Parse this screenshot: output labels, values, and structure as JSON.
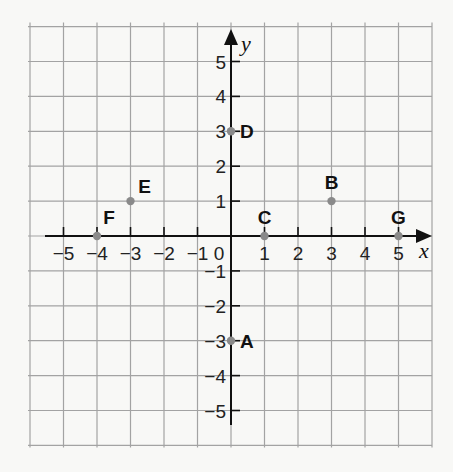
{
  "diagram": {
    "type": "coordinate-plane",
    "grid": {
      "x_min": -6,
      "x_max": 6,
      "y_min": -6,
      "y_max": 6
    },
    "axes": {
      "x_label": "x",
      "y_label": "y",
      "x_ticks": [
        {
          "value": -5,
          "label": "−5"
        },
        {
          "value": -4,
          "label": "−4"
        },
        {
          "value": -3,
          "label": "−3"
        },
        {
          "value": -2,
          "label": "−2"
        },
        {
          "value": -1,
          "label": "−1"
        },
        {
          "value": 0,
          "label": "0"
        },
        {
          "value": 1,
          "label": "1"
        },
        {
          "value": 2,
          "label": "2"
        },
        {
          "value": 3,
          "label": "3"
        },
        {
          "value": 4,
          "label": "4"
        },
        {
          "value": 5,
          "label": "5"
        }
      ],
      "y_ticks": [
        {
          "value": 5,
          "label": "5"
        },
        {
          "value": 4,
          "label": "4"
        },
        {
          "value": 3,
          "label": "3"
        },
        {
          "value": 2,
          "label": "2"
        },
        {
          "value": 1,
          "label": "1"
        },
        {
          "value": -1,
          "label": "−1"
        },
        {
          "value": -2,
          "label": "−2"
        },
        {
          "value": -3,
          "label": "−3"
        },
        {
          "value": -4,
          "label": "−4"
        },
        {
          "value": -5,
          "label": "−5"
        }
      ]
    },
    "points": [
      {
        "label": "A",
        "x": 0,
        "y": -3
      },
      {
        "label": "B",
        "x": 3,
        "y": 1
      },
      {
        "label": "C",
        "x": 1,
        "y": 0
      },
      {
        "label": "D",
        "x": 0,
        "y": 3
      },
      {
        "label": "E",
        "x": -3,
        "y": 1
      },
      {
        "label": "F",
        "x": -4,
        "y": 0
      },
      {
        "label": "G",
        "x": 5,
        "y": 0
      }
    ],
    "colors": {
      "background": "#f8f8f6",
      "grid": "#a3a3a3",
      "axis": "#111111",
      "point": "#8a8a8a"
    }
  }
}
